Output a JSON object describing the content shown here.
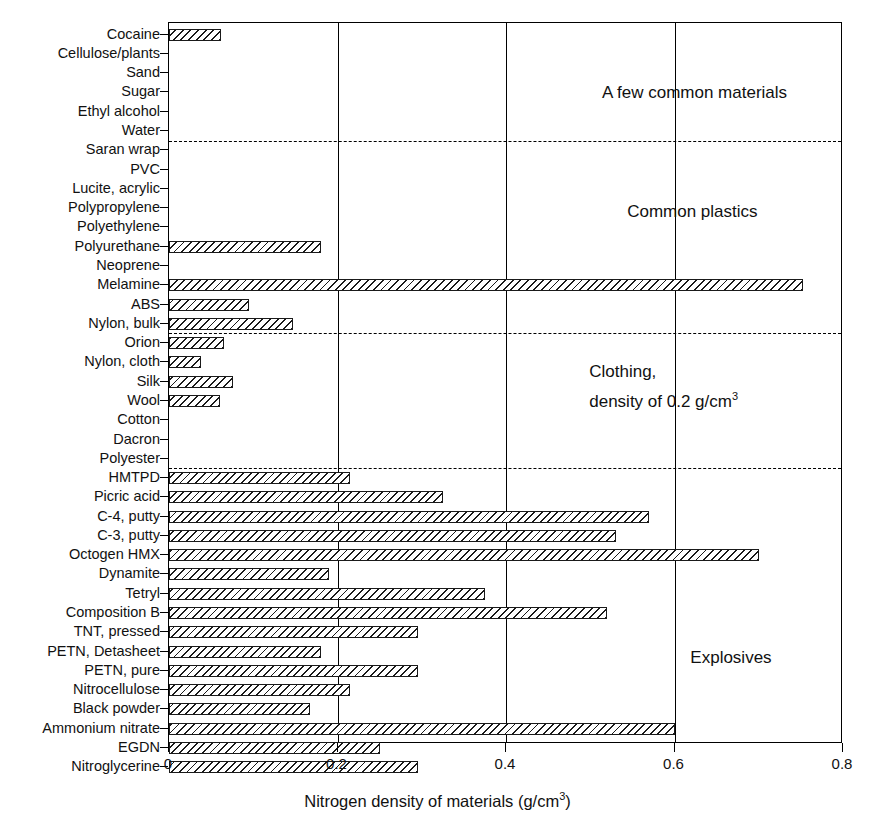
{
  "chart_data": {
    "type": "bar",
    "orientation": "horizontal",
    "title": "",
    "xlabel": "Nitrogen density of materials (g/cm3)",
    "xlabel_base": "Nitrogen density of materials (g/cm",
    "xlabel_sup": "3",
    "xlabel_tail": ")",
    "ylabel": "",
    "xlim": [
      0,
      0.8
    ],
    "xticks": [
      0,
      0.2,
      0.4,
      0.6,
      0.8
    ],
    "xticklabels": [
      "0",
      "0.2",
      "0.4",
      "0.6",
      "0.8"
    ],
    "grid": "vertical gridlines at 0.2, 0.4, 0.6",
    "legend": "none",
    "bar_fill": "black diagonal hatch on white",
    "categories": [
      "Cocaine",
      "Cellulose/plants",
      "Sand",
      "Sugar",
      "Ethyl alcohol",
      "Water",
      "Saran wrap",
      "PVC",
      "Lucite, acrylic",
      "Polypropylene",
      "Polyethylene",
      "Polyurethane",
      "Neoprene",
      "Melamine",
      "ABS",
      "Nylon, bulk",
      "Orion",
      "Nylon, cloth",
      "Silk",
      "Wool",
      "Cotton",
      "Dacron",
      "Polyester",
      "HMTPD",
      "Picric acid",
      "C-4, putty",
      "C-3, putty",
      "Octogen HMX",
      "Dynamite",
      "Tetryl",
      "Composition B",
      "TNT, pressed",
      "PETN, Detasheet",
      "PETN, pure",
      "Nitrocellulose",
      "Black powder",
      "Ammonium nitrate",
      "EGDN",
      "Nitroglycerine"
    ],
    "values": [
      0.062,
      0,
      0,
      0,
      0,
      0,
      0,
      0,
      0,
      0,
      0,
      0.18,
      0,
      0.752,
      0.095,
      0.147,
      0.065,
      0.038,
      0.076,
      0.06,
      0,
      0,
      0,
      0.215,
      0.325,
      0.57,
      0.53,
      0.7,
      0.19,
      0.375,
      0.52,
      0.295,
      0.18,
      0.295,
      0.215,
      0.167,
      0.6,
      0.25,
      0.295
    ],
    "groups": [
      {
        "label": "A few common materials",
        "start_index": 0,
        "end_index": 5
      },
      {
        "label": "Common plastics",
        "start_index": 6,
        "end_index": 15
      },
      {
        "label": "Clothing,\ndensity of 0.2 g/cm3",
        "start_index": 16,
        "end_index": 22
      },
      {
        "label": "Explosives",
        "start_index": 23,
        "end_index": 38
      }
    ],
    "annotations": [
      {
        "text": "A few common materials",
        "x": 0.515,
        "y_row": 3.1
      },
      {
        "text": "Common plastics",
        "x": 0.545,
        "y_row": 9.3
      },
      {
        "text": "Clothing,",
        "x": 0.5,
        "y_row": 17.6
      },
      {
        "text": "density of 0.2 g/cm",
        "sup": "3",
        "x": 0.5,
        "y_row": 18.9
      },
      {
        "text": "Explosives",
        "x": 0.62,
        "y_row": 32.4
      }
    ],
    "group_separators_after_index": [
      5,
      15,
      22
    ]
  }
}
